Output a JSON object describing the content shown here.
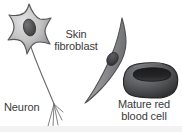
{
  "figure": {
    "width": 182,
    "height": 132,
    "background_color": "#ffffff"
  },
  "labels": {
    "neuron": "Neuron",
    "fibroblast_line1": "Skin",
    "fibroblast_line2": "fibroblast",
    "rbc_line1": "Mature red",
    "rbc_line2": "blood cell"
  },
  "cells": [
    {
      "id": "neuron",
      "name": "Neuron",
      "shape": "star-shaped cell body with long axon and terminal branches",
      "has_nucleus": true,
      "outline_color": "#55565a",
      "fill_light": "#d8d8d8",
      "fill_dark": "#8d8e90",
      "nucleus_color": "#4b4b4d"
    },
    {
      "id": "skin-fibroblast",
      "name": "Skin fibroblast",
      "shape": "elongated spindle-shaped cell",
      "has_nucleus": true,
      "outline_color": "#4f5053",
      "fill_light": "#cfcfcf",
      "fill_dark": "#77787b",
      "nucleus_color": "#3c3c3e"
    },
    {
      "id": "mature-red-blood-cell",
      "name": "Mature red blood cell",
      "shape": "biconcave disc with central depression",
      "has_nucleus": false,
      "outline_color": "#2d2d2f",
      "fill_light": "#6f7073",
      "fill_dark": "#303032",
      "nucleus_color": "#1b1b1c"
    }
  ],
  "icons": {
    "neuron": "neuron-cell-icon",
    "fibroblast": "fibroblast-cell-icon",
    "rbc": "red-blood-cell-icon"
  }
}
